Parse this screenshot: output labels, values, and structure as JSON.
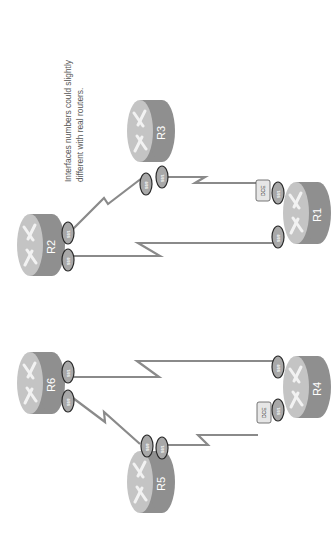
{
  "diagram": {
    "rotation": "90deg counter-clockwise (text reads bottom-to-top)",
    "note": [
      "Interfaces numbers could slightly",
      "different with real routers."
    ],
    "colors": {
      "router_top": "#c4c4c4",
      "router_body": "#8f8f8f",
      "router_arrows": "#f2f2f2",
      "interface_fill": "#a8a8a8",
      "interface_stroke": "#2a2a2a",
      "link": "#8a8a8a",
      "dce_fill": "#e6e6e6",
      "dce_stroke": "#555555"
    },
    "routers": [
      {
        "id": "R1",
        "label": "R1",
        "group": "left"
      },
      {
        "id": "R2",
        "label": "R2",
        "group": "left"
      },
      {
        "id": "R3",
        "label": "R3",
        "group": "left"
      },
      {
        "id": "R4",
        "label": "R4",
        "group": "right"
      },
      {
        "id": "R5",
        "label": "R5",
        "group": "right"
      },
      {
        "id": "R6",
        "label": "R6",
        "group": "right"
      }
    ],
    "interfaces": {
      "r1_a": "S0/1",
      "r1_b": "S0/0",
      "r2_a": "S0/1",
      "r2_b": "S0/0",
      "r3_a": "S0/0",
      "r3_b": "S0/1",
      "r4_a": "S0/0",
      "r4_b": "S0/1",
      "r5_a": "S0/0",
      "r5_b": "S0/1",
      "r6_a": "S0/1",
      "r6_b": "S0/0"
    },
    "dce_label": "DCE",
    "links": [
      {
        "from": "R3",
        "to": "R2",
        "type": "serial"
      },
      {
        "from": "R3",
        "to": "R1",
        "type": "serial",
        "dce": "R1"
      },
      {
        "from": "R2",
        "to": "R1",
        "type": "serial"
      },
      {
        "from": "R6",
        "to": "R5",
        "type": "serial"
      },
      {
        "from": "R6",
        "to": "R4",
        "type": "serial"
      },
      {
        "from": "R5",
        "to": "R4",
        "type": "serial",
        "dce": "R4"
      }
    ]
  }
}
